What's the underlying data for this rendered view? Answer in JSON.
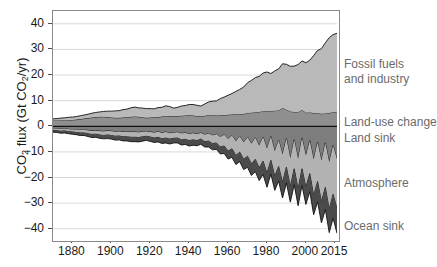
{
  "chart_data": {
    "type": "area",
    "title": "",
    "xlabel": "",
    "ylabel": "CO2 flux (Gt CO2/yr)",
    "ylabel_parts": {
      "pre": "CO",
      "sub1": "2",
      "mid": " flux (Gt CO",
      "sub2": "2",
      "post": "/yr)"
    },
    "xlim": [
      1870,
      2016
    ],
    "ylim": [
      -44,
      45
    ],
    "yticks": [
      40,
      30,
      20,
      10,
      0,
      -10,
      -20,
      -30,
      -40
    ],
    "ytick_labels": [
      "40",
      "30",
      "20",
      "10",
      "0",
      "−10",
      "−20",
      "−30",
      "−40"
    ],
    "xticks": [
      1880,
      1900,
      1920,
      1940,
      1960,
      1980,
      2000,
      2015
    ],
    "xtick_labels": [
      "1880",
      "1900",
      "1920",
      "1940",
      "1960",
      "1980",
      "2000",
      "2015"
    ],
    "grid": "horizontal",
    "legend_position": "right-outside",
    "stacking": "positive-up-negative-down",
    "colors": {
      "fossil_fuels": "#b9b9b9",
      "land_use_change": "#8f8f8f",
      "land_sink": "#7d7d7d",
      "atmosphere": "#b2b2b2",
      "ocean_sink": "#4b4b4b",
      "outline": "#111111",
      "frame": "#8a8a8a",
      "gridline": "#d9d9d9",
      "legend_text": "#6b6b6b",
      "tick_text": "#1a1a1a"
    },
    "legend": [
      {
        "label": "Fossil fuels",
        "key": "fossil_fuels",
        "y": 57
      },
      {
        "label": " and industry",
        "key": "fossil_fuels_2",
        "y": 72
      },
      {
        "label": "Land-use change",
        "key": "land_use_change",
        "y": 115
      },
      {
        "label": "Land sink",
        "key": "land_sink",
        "y": 131
      },
      {
        "label": "Atmosphere",
        "key": "atmosphere",
        "y": 176
      },
      {
        "label": "Ocean sink",
        "key": "ocean_sink",
        "y": 219
      }
    ],
    "x": [
      1870,
      1872,
      1874,
      1876,
      1878,
      1880,
      1882,
      1884,
      1886,
      1888,
      1890,
      1892,
      1894,
      1896,
      1898,
      1900,
      1902,
      1904,
      1906,
      1908,
      1910,
      1912,
      1914,
      1916,
      1918,
      1920,
      1922,
      1924,
      1926,
      1928,
      1930,
      1932,
      1934,
      1936,
      1938,
      1940,
      1942,
      1944,
      1946,
      1948,
      1950,
      1952,
      1954,
      1956,
      1958,
      1960,
      1962,
      1964,
      1966,
      1968,
      1970,
      1972,
      1974,
      1976,
      1978,
      1980,
      1982,
      1984,
      1986,
      1988,
      1990,
      1992,
      1994,
      1996,
      1998,
      2000,
      2002,
      2004,
      2006,
      2008,
      2010,
      2012,
      2014,
      2016
    ],
    "series": [
      {
        "name": "Fossil fuels and industry",
        "key": "fossil_fuels",
        "sign": "positive",
        "unit": "Gt CO2/yr",
        "values": [
          0.6,
          0.7,
          0.8,
          0.9,
          1.0,
          1.1,
          1.2,
          1.3,
          1.4,
          1.5,
          1.7,
          1.8,
          1.9,
          2.1,
          2.3,
          2.5,
          2.7,
          2.8,
          3.1,
          3.2,
          3.5,
          3.7,
          3.5,
          3.6,
          3.6,
          3.5,
          3.3,
          3.7,
          3.6,
          4.1,
          3.7,
          3.1,
          3.4,
          3.8,
          3.9,
          4.2,
          4.3,
          4.2,
          4.0,
          4.6,
          5.2,
          5.5,
          5.7,
          6.5,
          7.0,
          7.6,
          8.2,
          8.9,
          9.7,
          10.5,
          11.8,
          12.6,
          13.5,
          13.9,
          14.9,
          15.2,
          14.7,
          15.5,
          16.2,
          17.3,
          17.7,
          17.6,
          17.9,
          18.7,
          19.0,
          19.5,
          20.4,
          22.4,
          24.5,
          25.4,
          27.6,
          29.4,
          30.3,
          30.6
        ]
      },
      {
        "name": "Land-use change",
        "key": "land_use_change",
        "sign": "positive",
        "unit": "Gt CO2/yr",
        "values": [
          2.3,
          2.3,
          2.4,
          2.4,
          2.5,
          2.5,
          2.6,
          2.8,
          3.0,
          3.2,
          3.4,
          3.6,
          3.7,
          3.7,
          3.6,
          3.4,
          3.3,
          3.3,
          3.4,
          3.5,
          3.7,
          3.8,
          3.7,
          3.5,
          3.3,
          3.4,
          3.5,
          3.6,
          3.8,
          3.9,
          4.0,
          4.0,
          4.0,
          4.1,
          4.2,
          4.3,
          4.2,
          4.0,
          3.9,
          4.1,
          4.3,
          4.3,
          4.2,
          4.3,
          4.4,
          4.5,
          4.6,
          4.7,
          4.7,
          4.8,
          5.2,
          5.3,
          5.5,
          5.6,
          5.9,
          6.0,
          5.9,
          6.1,
          6.2,
          7.1,
          6.5,
          5.8,
          5.6,
          5.4,
          6.5,
          5.3,
          5.4,
          5.2,
          5.1,
          4.9,
          5.0,
          5.2,
          5.5,
          5.7
        ]
      },
      {
        "name": "Land sink",
        "key": "land_sink",
        "sign": "negative",
        "unit": "Gt CO2/yr",
        "values": [
          -0.9,
          -1.0,
          -1.1,
          -1.0,
          -1.2,
          -1.3,
          -1.4,
          -1.5,
          -1.4,
          -1.6,
          -1.8,
          -1.7,
          -1.9,
          -2.0,
          -1.8,
          -1.9,
          -2.1,
          -2.0,
          -2.2,
          -2.1,
          -2.3,
          -2.2,
          -2.4,
          -2.1,
          -2.0,
          -2.2,
          -2.5,
          -2.1,
          -2.6,
          -2.2,
          -2.7,
          -2.5,
          -2.3,
          -2.8,
          -2.6,
          -3.0,
          -2.7,
          -3.1,
          -2.6,
          -3.3,
          -2.8,
          -3.6,
          -3.1,
          -4.2,
          -3.3,
          -5.0,
          -3.6,
          -5.8,
          -4.0,
          -6.3,
          -4.3,
          -6.8,
          -4.5,
          -7.6,
          -4.2,
          -8.8,
          -4.0,
          -9.7,
          -5.5,
          -11.0,
          -4.8,
          -12.5,
          -5.3,
          -12.8,
          -4.6,
          -11.5,
          -5.6,
          -13.0,
          -6.2,
          -13.5,
          -6.5,
          -14.0,
          -7.5,
          -13.0
        ]
      },
      {
        "name": "Atmosphere",
        "key": "atmosphere",
        "sign": "negative",
        "unit": "Gt CO2/yr",
        "values": [
          -0.7,
          -0.7,
          -0.8,
          -0.8,
          -0.9,
          -0.9,
          -1.0,
          -1.1,
          -1.2,
          -1.3,
          -1.4,
          -1.4,
          -1.5,
          -1.6,
          -1.6,
          -1.7,
          -1.8,
          -1.8,
          -1.9,
          -2.0,
          -2.0,
          -2.1,
          -2.0,
          -2.0,
          -1.9,
          -2.0,
          -2.1,
          -2.2,
          -2.3,
          -2.4,
          -2.3,
          -2.2,
          -2.3,
          -2.5,
          -2.5,
          -2.6,
          -2.6,
          -2.5,
          -2.4,
          -2.7,
          -3.0,
          -3.2,
          -3.4,
          -3.9,
          -4.4,
          -4.7,
          -5.2,
          -5.6,
          -6.1,
          -6.6,
          -7.4,
          -7.9,
          -8.4,
          -8.7,
          -9.4,
          -9.6,
          -9.3,
          -9.8,
          -10.2,
          -11.0,
          -11.2,
          -11.1,
          -11.3,
          -11.8,
          -12.0,
          -12.3,
          -12.9,
          -14.1,
          -15.4,
          -16.0,
          -17.4,
          -18.5,
          -19.1,
          -19.3
        ]
      },
      {
        "name": "Ocean sink",
        "key": "ocean_sink",
        "sign": "negative",
        "unit": "Gt CO2/yr",
        "values": [
          -0.7,
          -0.7,
          -0.8,
          -0.8,
          -0.8,
          -0.9,
          -0.9,
          -1.0,
          -1.0,
          -1.1,
          -1.2,
          -1.2,
          -1.3,
          -1.3,
          -1.4,
          -1.4,
          -1.5,
          -1.5,
          -1.6,
          -1.6,
          -1.7,
          -1.7,
          -1.7,
          -1.7,
          -1.6,
          -1.7,
          -1.7,
          -1.8,
          -1.8,
          -1.9,
          -1.9,
          -1.8,
          -1.9,
          -2.0,
          -2.0,
          -2.1,
          -2.1,
          -2.0,
          -2.0,
          -2.1,
          -2.3,
          -2.4,
          -2.5,
          -2.7,
          -2.9,
          -3.1,
          -3.3,
          -3.5,
          -3.7,
          -4.0,
          -4.3,
          -4.5,
          -4.8,
          -4.9,
          -5.2,
          -5.4,
          -5.3,
          -5.5,
          -5.7,
          -6.0,
          -6.1,
          -6.0,
          -6.2,
          -6.4,
          -6.5,
          -6.7,
          -7.0,
          -7.4,
          -7.9,
          -8.2,
          -8.6,
          -9.0,
          -9.3,
          -9.5
        ]
      }
    ]
  }
}
